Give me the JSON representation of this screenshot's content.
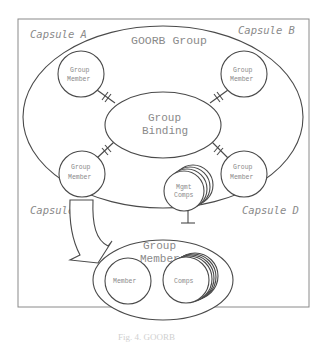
{
  "diagram": {
    "capsules": {
      "a": "Capsule A",
      "b": "Capsule B",
      "c": "Capsule C",
      "d": "Capsule D"
    },
    "group_title": "GOORB Group",
    "binding": {
      "line1": "Group",
      "line2": "Binding"
    },
    "members": [
      {
        "line1": "Group",
        "line2": "Member"
      },
      {
        "line1": "Group",
        "line2": "Member"
      },
      {
        "line1": "Group",
        "line2": "Member"
      },
      {
        "line1": "Group",
        "line2": "Member"
      }
    ],
    "mgmt": {
      "line1": "Mgmt",
      "line2": "Comps"
    },
    "detail": {
      "title_line1": "Group",
      "title_line2": "Member",
      "member": "Member",
      "comps": "Comps"
    },
    "caption": "Fig. 4. GOORB"
  }
}
